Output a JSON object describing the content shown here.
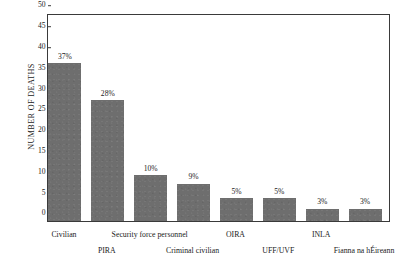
{
  "chart_data": {
    "type": "bar",
    "title": "",
    "subtitle": "",
    "xlabel": "",
    "ylabel": "NUMBER OF DEATHS",
    "ylim": [
      0,
      50
    ],
    "yticks": [
      0,
      5,
      10,
      15,
      20,
      25,
      30,
      35,
      40,
      45,
      50
    ],
    "grid": false,
    "legend": "none",
    "bar_color": "#6e6e6e",
    "axis_color": "#3a3a3a",
    "categories": [
      "Civilian",
      "PIRA",
      "Security force personnel",
      "Criminal civilian",
      "OIRA",
      "UFF/UVF",
      "INLA",
      "Fianna na hÉireann"
    ],
    "values": [
      38,
      29,
      11,
      9,
      5.5,
      5.5,
      3,
      3
    ],
    "data_labels": [
      "37%",
      "28%",
      "10%",
      "9%",
      "5%",
      "5%",
      "3%",
      "3%"
    ],
    "label_rows": [
      "top",
      "bottom",
      "top",
      "bottom",
      "top",
      "bottom",
      "top",
      "bottom"
    ],
    "bars": [
      {
        "category": "Civilian",
        "value": 38,
        "label": "37%",
        "percent": 37,
        "row": "top"
      },
      {
        "category": "PIRA",
        "value": 29,
        "label": "28%",
        "percent": 28,
        "row": "bottom"
      },
      {
        "category": "Security force personnel",
        "value": 11,
        "label": "10%",
        "percent": 10,
        "row": "top"
      },
      {
        "category": "Criminal civilian",
        "value": 9,
        "label": "9%",
        "percent": 9,
        "row": "bottom"
      },
      {
        "category": "OIRA",
        "value": 5.5,
        "label": "5%",
        "percent": 5,
        "row": "top"
      },
      {
        "category": "UFF/UVF",
        "value": 5.5,
        "label": "5%",
        "percent": 5,
        "row": "bottom"
      },
      {
        "category": "INLA",
        "value": 3,
        "label": "3%",
        "percent": 3,
        "row": "top"
      },
      {
        "category": "Fianna na hÉireann",
        "value": 3,
        "label": "3%",
        "percent": 3,
        "row": "bottom"
      }
    ]
  }
}
